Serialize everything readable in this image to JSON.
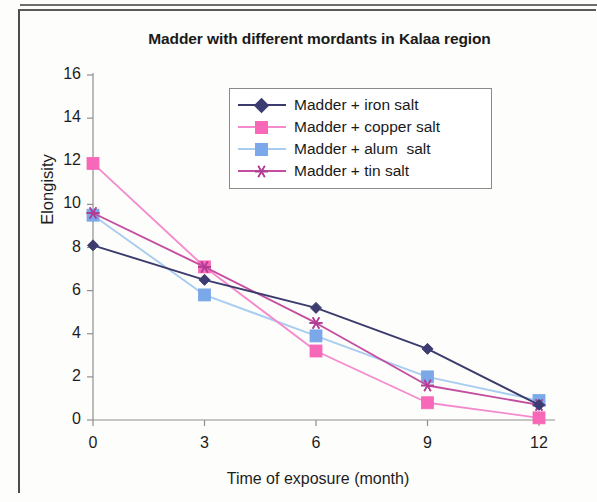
{
  "chart_data": {
    "type": "line",
    "title": "Madder with different mordants in Kalaa region",
    "xlabel": "Time of exposure (month)",
    "ylabel": "Elongisity",
    "x": [
      0,
      3,
      6,
      9,
      12
    ],
    "xticklabels": [
      "0",
      "3",
      "6",
      "9",
      "12"
    ],
    "yticklabels": [
      "0",
      "2",
      "4",
      "6",
      "8",
      "10",
      "12",
      "14",
      "16"
    ],
    "ylim": [
      0,
      16
    ],
    "xlim": [
      0,
      12
    ],
    "ytick_step": 2,
    "grid": false,
    "legend_position": "upper-center-inside",
    "series": [
      {
        "name": "Madder + iron salt",
        "color": "#3b3b6e",
        "marker": "diamond",
        "marker_color": "#3c3c70",
        "values": [
          8.1,
          6.5,
          5.2,
          3.3,
          0.7
        ]
      },
      {
        "name": "Madder + copper salt",
        "color": "#f48bcd",
        "marker": "square",
        "marker_color": "#f868b8",
        "values": [
          11.9,
          7.1,
          3.2,
          0.8,
          0.1
        ]
      },
      {
        "name": "Madder + alum  salt",
        "color": "#a8cdf0",
        "marker": "square",
        "marker_color": "#7aa8e8",
        "values": [
          9.5,
          5.8,
          3.9,
          2.0,
          0.9
        ]
      },
      {
        "name": "Madder + tin salt",
        "color": "#c44da0",
        "marker": "star",
        "marker_color": "#b23d95",
        "values": [
          9.6,
          7.1,
          4.5,
          1.6,
          0.7
        ]
      }
    ]
  },
  "axis": {
    "y_label": "Elongisity",
    "x_label": "Time of exposure (month)",
    "y_ticks": [
      "16",
      "14",
      "12",
      "10",
      "8",
      "6",
      "4",
      "2",
      "0"
    ],
    "x_ticks": [
      "0",
      "3",
      "6",
      "9",
      "12"
    ]
  },
  "legend": {
    "items": [
      {
        "label": "Madder + iron salt"
      },
      {
        "label": "Madder + copper salt"
      },
      {
        "label": "Madder + alum  salt"
      },
      {
        "label": "Madder + tin salt"
      }
    ]
  },
  "colors": {
    "iron": "#3b3b6e",
    "copper": "#f868b8",
    "alum": "#a8cdf0",
    "tin": "#c44da0",
    "axis": "#8f8f8f",
    "text": "#1a1a1a"
  }
}
